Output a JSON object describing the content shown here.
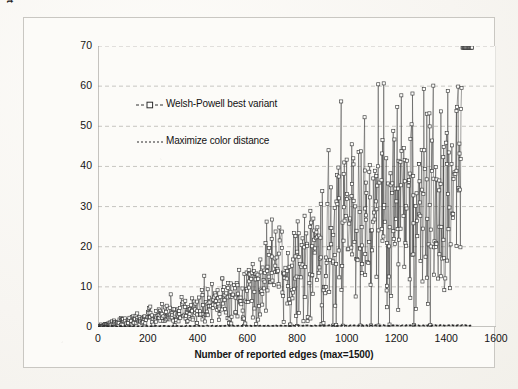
{
  "chart_data": {
    "type": "scatter",
    "title": "",
    "subtitle": "",
    "xlabel": "Number of reported edges (max=1500)",
    "ylabel": "Everage PCI reassignments per single edge report",
    "xlim": [
      0,
      1600
    ],
    "ylim": [
      0,
      70
    ],
    "xticks": [
      0,
      200,
      400,
      600,
      800,
      1000,
      1200,
      1400,
      1600
    ],
    "yticks": [
      0,
      10,
      20,
      30,
      40,
      50,
      60,
      70
    ],
    "grid": "horizontal-dashed",
    "legend_position": "inside-upper-left",
    "colors": {
      "series_welsh_powell": "#333333",
      "series_max_color_distance": "#2a2a2a",
      "gridline": "#b9b7b2",
      "axis": "#8d8b86",
      "plot_background": "#fcfbf8",
      "page_background": "#f7f5f1",
      "text": "#141414"
    },
    "series": [
      {
        "name": "Welsh-Powell best variant",
        "marker": "open-square",
        "line_style": "solid-thin",
        "description": "Noisy per-run values rising super-linearly with expanding spread",
        "x": [
          10,
          20,
          30,
          40,
          50,
          60,
          70,
          80,
          90,
          100,
          110,
          120,
          130,
          140,
          150,
          160,
          170,
          180,
          190,
          200,
          210,
          220,
          230,
          240,
          250,
          260,
          270,
          280,
          290,
          300,
          310,
          320,
          330,
          340,
          350,
          360,
          370,
          380,
          390,
          400,
          410,
          420,
          430,
          440,
          450,
          460,
          470,
          480,
          490,
          500,
          510,
          520,
          530,
          540,
          550,
          560,
          570,
          580,
          590,
          600,
          610,
          620,
          630,
          640,
          650,
          660,
          670,
          680,
          690,
          700,
          710,
          720,
          730,
          740,
          750,
          760,
          770,
          780,
          790,
          800,
          810,
          820,
          830,
          840,
          850,
          860,
          870,
          880,
          890,
          900,
          910,
          920,
          930,
          940,
          950,
          960,
          970,
          980,
          990,
          1000,
          1010,
          1020,
          1030,
          1040,
          1050,
          1060,
          1070,
          1080,
          1090,
          1100,
          1110,
          1120,
          1130,
          1140,
          1150,
          1160,
          1170,
          1180,
          1190,
          1200,
          1210,
          1220,
          1230,
          1240,
          1250,
          1260,
          1270,
          1280,
          1290,
          1300,
          1310,
          1320,
          1330,
          1340,
          1350,
          1360,
          1370,
          1380,
          1390,
          1400,
          1410,
          1420,
          1430,
          1440,
          1450,
          1460,
          1470,
          1480,
          1490,
          1500
        ],
        "y_mean": [
          0.4,
          0.5,
          0.6,
          0.7,
          0.8,
          0.9,
          1.0,
          1.1,
          1.2,
          1.3,
          1.4,
          1.5,
          1.6,
          1.7,
          1.8,
          1.9,
          2.0,
          2.1,
          2.2,
          2.3,
          2.4,
          2.5,
          2.6,
          2.7,
          2.8,
          2.9,
          3.0,
          3.1,
          3.2,
          3.3,
          3.5,
          3.6,
          3.7,
          3.9,
          4.0,
          4.2,
          4.3,
          4.5,
          4.6,
          4.8,
          5.0,
          5.1,
          5.3,
          5.5,
          5.7,
          5.9,
          6.1,
          6.3,
          6.5,
          6.7,
          6.9,
          7.1,
          7.3,
          7.6,
          7.8,
          8.0,
          8.3,
          8.5,
          8.8,
          9.0,
          9.3,
          9.6,
          9.8,
          10.1,
          10.4,
          10.7,
          11.0,
          11.3,
          11.6,
          11.9,
          12.2,
          12.6,
          12.9,
          13.2,
          13.6,
          13.9,
          14.3,
          14.6,
          15.0,
          15.4,
          15.7,
          16.1,
          16.5,
          16.9,
          17.3,
          17.7,
          18.1,
          18.5,
          18.9,
          19.3,
          19.7,
          20.1,
          20.5,
          20.9,
          21.3,
          21.7,
          22.1,
          22.5,
          22.9,
          23.3,
          23.7,
          24.1,
          24.5,
          24.8,
          25.2,
          25.6,
          25.9,
          26.3,
          26.6,
          27.0,
          27.3,
          27.6,
          27.9,
          28.2,
          28.5,
          28.8,
          29.1,
          29.3,
          29.6,
          29.8,
          30.1,
          30.3,
          30.5,
          30.7,
          30.9,
          31.1,
          31.3,
          31.5,
          31.6,
          31.8,
          32.0,
          32.1,
          32.3,
          32.4,
          32.6,
          32.7,
          32.8,
          33.0,
          33.1,
          33.2,
          33.3,
          33.4,
          33.5,
          33.6,
          33.7,
          33.8,
          33.9,
          34.0
        ],
        "y_spread": [
          0.3,
          0.3,
          0.3,
          0.4,
          0.4,
          0.4,
          0.5,
          0.5,
          0.5,
          0.6,
          0.6,
          0.6,
          0.7,
          0.7,
          0.7,
          0.8,
          0.8,
          0.8,
          0.9,
          0.9,
          1.0,
          1.0,
          1.0,
          1.1,
          1.1,
          1.2,
          1.2,
          1.3,
          1.3,
          1.4,
          1.4,
          1.5,
          1.5,
          1.6,
          1.6,
          1.7,
          1.8,
          1.8,
          1.9,
          2.0,
          2.0,
          2.1,
          2.2,
          2.3,
          2.3,
          2.4,
          2.5,
          2.6,
          2.7,
          2.8,
          2.9,
          3.0,
          3.1,
          3.2,
          3.3,
          3.4,
          3.5,
          3.6,
          3.7,
          3.9,
          4.0,
          4.1,
          4.3,
          4.4,
          4.5,
          4.7,
          4.8,
          5.0,
          5.1,
          5.3,
          5.5,
          5.6,
          5.8,
          6.0,
          6.2,
          6.3,
          6.5,
          6.7,
          6.9,
          7.1,
          7.3,
          7.5,
          7.7,
          7.9,
          8.1,
          8.3,
          8.5,
          8.7,
          8.9,
          9.1,
          9.3,
          9.5,
          9.7,
          9.9,
          10.1,
          10.3,
          10.5,
          10.7,
          10.9,
          11.1,
          11.3,
          11.5,
          11.7,
          11.8,
          12.0,
          12.2,
          12.3,
          12.5,
          12.6,
          12.8,
          12.9,
          13.1,
          13.2,
          13.3,
          13.5,
          13.6,
          13.7,
          13.8,
          13.9,
          14.0,
          14.1,
          14.2,
          14.3,
          14.4,
          14.5,
          14.6,
          14.7,
          14.8,
          14.8,
          14.9,
          15.0,
          15.0,
          15.1,
          15.2,
          15.2,
          15.3,
          15.3,
          15.4,
          15.4,
          15.5,
          15.5,
          15.6,
          15.6,
          15.7,
          15.7,
          15.8
        ],
        "y_min_observed": 0.2,
        "y_max_observed": 61.0,
        "points_per_x": 5
      },
      {
        "name": "Maximize color distance",
        "marker": "none",
        "line_style": "dotted",
        "description": "Essentially flat near zero across the whole range",
        "x": [
          0,
          200,
          400,
          600,
          800,
          1000,
          1200,
          1400,
          1500
        ],
        "y": [
          0.2,
          0.25,
          0.3,
          0.3,
          0.35,
          0.35,
          0.4,
          0.4,
          0.4
        ],
        "y_min_observed": 0.2,
        "y_max_observed": 0.4
      }
    ],
    "legend": [
      {
        "label": "Welsh-Powell best variant",
        "marker": "open-square-dashed"
      },
      {
        "label": "Maximize color distance",
        "marker": "dotted-line"
      }
    ]
  }
}
